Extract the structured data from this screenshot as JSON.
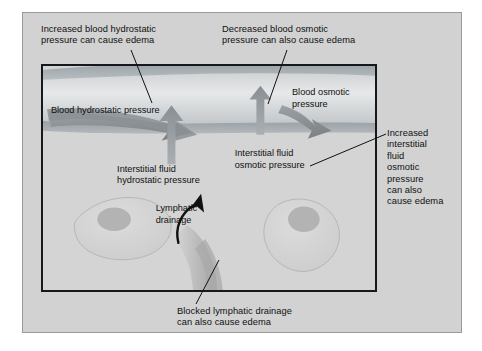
{
  "figure": {
    "background_color": "#ffffff",
    "panel_color": "#d2d2d2",
    "frame_color": "#15191c",
    "vessel_color": "#a8aeb2",
    "arrow_color": "#8e9498",
    "cell_color": "#cdcdcd",
    "nucleus_color": "#b4b4b4",
    "lymph_color": "#c2c2c2"
  },
  "callouts": {
    "increased_blood_hydrostatic": "Increased blood hydrostatic\npressure can cause edema",
    "decreased_blood_osmotic": "Decreased blood osmotic\npressure can also cause edema",
    "increased_interstitial_osmotic": "Increased\ninterstitial\nfluid\nosmotic\npressure\ncan also\ncause edema",
    "blocked_lymphatic": "Blocked lymphatic drainage\ncan also cause edema"
  },
  "inner_labels": {
    "blood_hydrostatic_pressure": "Blood hydrostatic pressure",
    "blood_osmotic_pressure": "Blood osmotic\npressure",
    "interstitial_fluid_hydrostatic_pressure": "Interstitial fluid\nhydrostatic pressure",
    "interstitial_fluid_osmotic_pressure": "Interstitial fluid\nosmotic pressure",
    "lymphatic_drainage": "Lymphatic\ndrainage"
  },
  "icons": {
    "capillary": "capillary-vessel-icon",
    "outflow_arrow": "outflow-arrow-icon",
    "inflow_arrow": "inflow-arrow-icon",
    "lymph_vessel": "lymphatic-vessel-icon",
    "lymph_flow_arrow": "lymphatic-flow-arrow-icon",
    "tissue_cell": "tissue-cell-icon"
  }
}
